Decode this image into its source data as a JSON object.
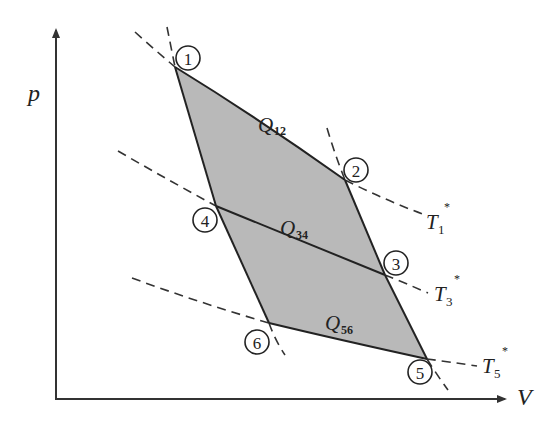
{
  "diagram": {
    "type": "p-V thermodynamic cycle diagram",
    "axes": {
      "y_label": "p",
      "x_label": "V"
    },
    "points": [
      {
        "id": "1",
        "label": "1"
      },
      {
        "id": "2",
        "label": "2"
      },
      {
        "id": "3",
        "label": "3"
      },
      {
        "id": "4",
        "label": "4"
      },
      {
        "id": "5",
        "label": "5"
      },
      {
        "id": "6",
        "label": "6"
      }
    ],
    "heat_labels": [
      {
        "id": "Q12",
        "main": "Q",
        "sub": "12"
      },
      {
        "id": "Q34",
        "main": "Q",
        "sub": "34"
      },
      {
        "id": "Q56",
        "main": "Q",
        "sub": "56"
      }
    ],
    "isotherm_labels": [
      {
        "id": "T1",
        "main": "T",
        "sub": "1",
        "sup": "*"
      },
      {
        "id": "T3",
        "main": "T",
        "sub": "3",
        "sup": "*"
      },
      {
        "id": "T5",
        "main": "T",
        "sub": "5",
        "sup": "*"
      }
    ],
    "colors": {
      "shaded_region": "#b9b9b9",
      "lines": "#222222",
      "background": "#ffffff"
    }
  }
}
